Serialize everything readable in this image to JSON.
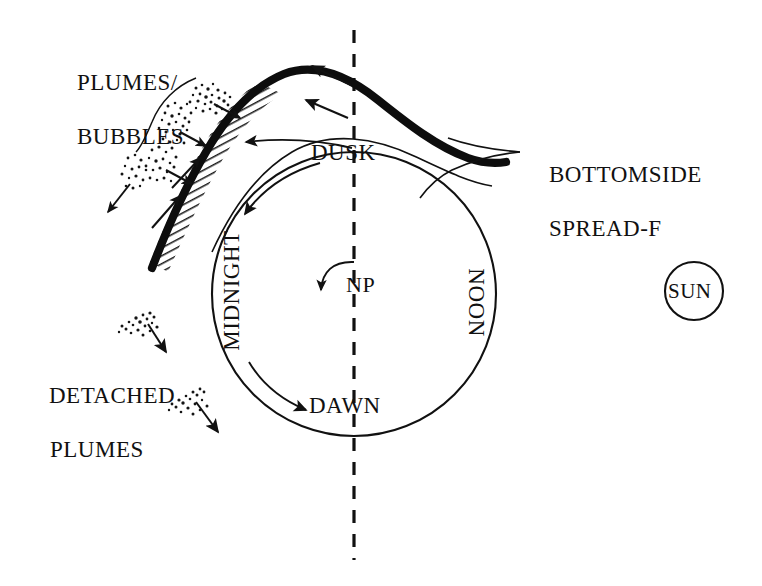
{
  "figure": {
    "type": "schematic-diagram",
    "background_color": "#ffffff",
    "ink_color": "#111111"
  },
  "labels": {
    "plumes_bubbles_line1": "PLUMES/",
    "plumes_bubbles_line2": "BUBBLES",
    "detached_line1": "DETACHED",
    "detached_line2": "PLUMES",
    "bottomside_line1": "BOTTOMSIDE",
    "bottomside_line2": "SPREAD-F",
    "dusk": "DUSK",
    "dawn": "DAWN",
    "midnight": "MIDNIGHT",
    "noon": "NOON",
    "np": "NP",
    "sun": "SUN"
  },
  "geometry": {
    "earth_circle": {
      "cx": 354,
      "cy": 294,
      "r": 142
    },
    "sun_circle": {
      "cx": 694,
      "cy": 291,
      "r": 29
    },
    "terminator_dashed_line_x": 354,
    "terminator_dashed_top_y": 30,
    "terminator_dashed_bottom_y": 560
  },
  "elements": {
    "thick_band_name": "bottomside-spread-f-band",
    "hatched_band_name": "plume-hatched-region",
    "rotation_arrow_name": "north-pole-rotation-arrow",
    "dusk_to_midnight_arrow": "dusk-to-midnight-arrow",
    "midnight_to_dawn_arrow": "midnight-to-dawn-arrow",
    "drift_arrows_count": 2,
    "detached_plume_count": 2,
    "attached_plume_count": 4
  },
  "colors": {
    "stroke": "#111111",
    "thick_curve": "#0d0d0d",
    "hatch": "#1a1a1a",
    "paper": "#ffffff"
  }
}
